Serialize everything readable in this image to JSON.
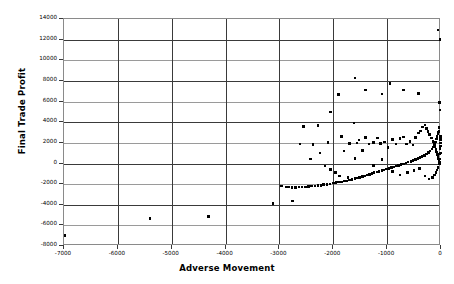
{
  "chart_data": {
    "type": "scatter",
    "title": "",
    "xlabel": "Adverse Movement",
    "ylabel": "Final Trade Profit",
    "xlim": [
      -7000,
      0
    ],
    "ylim": [
      -8000,
      14000
    ],
    "xticks": [
      -7000,
      -6000,
      -5000,
      -4000,
      -3000,
      -2000,
      -1000,
      0
    ],
    "xtick_labels": [
      "-7000",
      "-6000",
      "-5000",
      "-4000",
      "-3000",
      "-2000",
      "-1000",
      "0"
    ],
    "yticks": [
      -8000,
      -6000,
      -4000,
      -2000,
      0,
      2000,
      4000,
      6000,
      8000,
      10000,
      12000,
      14000
    ],
    "ytick_labels": [
      "-8000",
      "-6000",
      "-4000",
      "-2000",
      "0",
      "2000",
      "4000",
      "6000",
      "8000",
      "10000",
      "12000",
      "14000"
    ],
    "grid": true,
    "legend": null,
    "marker": "square",
    "marker_color": "#000000",
    "series": [
      {
        "name": "trades",
        "points": [
          [
            -6980,
            -7000
          ],
          [
            -5400,
            -5350
          ],
          [
            -4320,
            -5130
          ],
          [
            -3120,
            -3880
          ],
          [
            -2760,
            -3620
          ],
          [
            -2960,
            -2180
          ],
          [
            -2880,
            -2260
          ],
          [
            -2830,
            -2300
          ],
          [
            -2770,
            -2330
          ],
          [
            -2700,
            -2350
          ],
          [
            -2640,
            -2300
          ],
          [
            -2580,
            -2270
          ],
          [
            -2520,
            -2300
          ],
          [
            -2460,
            -2250
          ],
          [
            -2400,
            -2180
          ],
          [
            -2340,
            -2200
          ],
          [
            -2280,
            -2150
          ],
          [
            -2230,
            -2120
          ],
          [
            -2180,
            -2060
          ],
          [
            -2120,
            -2020
          ],
          [
            -2060,
            -1980
          ],
          [
            -2000,
            -1900
          ],
          [
            -1950,
            -1860
          ],
          [
            -1900,
            -1800
          ],
          [
            -1850,
            -1790
          ],
          [
            -1800,
            -1720
          ],
          [
            -1750,
            -1680
          ],
          [
            -1700,
            -1600
          ],
          [
            -1650,
            -1560
          ],
          [
            -1600,
            -1480
          ],
          [
            -1560,
            -1420
          ],
          [
            -1510,
            -1350
          ],
          [
            -1460,
            -1280
          ],
          [
            -1420,
            -1200
          ],
          [
            -1370,
            -1130
          ],
          [
            -1330,
            -1050
          ],
          [
            -1280,
            -980
          ],
          [
            -1240,
            -900
          ],
          [
            -1190,
            -830
          ],
          [
            -1150,
            -760
          ],
          [
            -1100,
            -680
          ],
          [
            -1060,
            -620
          ],
          [
            -1010,
            -540
          ],
          [
            -970,
            -470
          ],
          [
            -920,
            -400
          ],
          [
            -880,
            -320
          ],
          [
            -830,
            -250
          ],
          [
            -790,
            -180
          ],
          [
            -740,
            -100
          ],
          [
            -700,
            -40
          ],
          [
            -650,
            40
          ],
          [
            -610,
            120
          ],
          [
            -560,
            200
          ],
          [
            -520,
            280
          ],
          [
            -470,
            380
          ],
          [
            -430,
            460
          ],
          [
            -390,
            560
          ],
          [
            -350,
            660
          ],
          [
            -310,
            780
          ],
          [
            -270,
            900
          ],
          [
            -230,
            1050
          ],
          [
            -200,
            1200
          ],
          [
            -170,
            1400
          ],
          [
            -145,
            1600
          ],
          [
            -120,
            1850
          ],
          [
            -100,
            2100
          ],
          [
            -85,
            2350
          ],
          [
            -70,
            2600
          ],
          [
            -58,
            2850
          ],
          [
            -48,
            3050
          ],
          [
            -40,
            3150
          ],
          [
            -2380,
            1850
          ],
          [
            -2250,
            1000
          ],
          [
            -2100,
            2050
          ],
          [
            -1850,
            2600
          ],
          [
            -1800,
            1200
          ],
          [
            -1700,
            1950
          ],
          [
            -1620,
            3900
          ],
          [
            -1560,
            2000
          ],
          [
            -1520,
            2250
          ],
          [
            -1460,
            1250
          ],
          [
            -1400,
            2500
          ],
          [
            -1340,
            1900
          ],
          [
            -1250,
            2050
          ],
          [
            -1180,
            2450
          ],
          [
            -1120,
            1950
          ],
          [
            -1050,
            2100
          ],
          [
            -980,
            1550
          ],
          [
            -900,
            2300
          ],
          [
            -840,
            1900
          ],
          [
            -760,
            2400
          ],
          [
            -700,
            2550
          ],
          [
            -640,
            1900
          ],
          [
            -580,
            2150
          ],
          [
            -520,
            1800
          ],
          [
            -470,
            2500
          ],
          [
            -420,
            2950
          ],
          [
            -380,
            3150
          ],
          [
            -340,
            3550
          ],
          [
            -300,
            3750
          ],
          [
            -270,
            3400
          ],
          [
            -240,
            3100
          ],
          [
            -210,
            2800
          ],
          [
            -180,
            2450
          ],
          [
            -150,
            2150
          ],
          [
            -130,
            1900
          ],
          [
            -110,
            1600
          ],
          [
            -95,
            1350
          ],
          [
            -80,
            1100
          ],
          [
            -65,
            850
          ],
          [
            -55,
            650
          ],
          [
            -45,
            450
          ],
          [
            -38,
            250
          ],
          [
            -30,
            100
          ],
          [
            -25,
            -50
          ],
          [
            -20,
            450
          ],
          [
            -18,
            900
          ],
          [
            -15,
            1450
          ],
          [
            -12,
            2000
          ],
          [
            -10,
            2600
          ],
          [
            -20,
            5200
          ],
          [
            -25,
            5900
          ],
          [
            -15,
            12000
          ],
          [
            -60,
            12950
          ],
          [
            -420,
            6800
          ],
          [
            -700,
            7100
          ],
          [
            -950,
            7750
          ],
          [
            -1100,
            6750
          ],
          [
            -1400,
            7100
          ],
          [
            -1600,
            8300
          ],
          [
            -1900,
            6700
          ],
          [
            -2050,
            5000
          ],
          [
            -2280,
            3700
          ],
          [
            -2550,
            3600
          ],
          [
            -2620,
            1900
          ],
          [
            -2420,
            450
          ],
          [
            -2150,
            -250
          ],
          [
            -2050,
            -580
          ],
          [
            -1960,
            -900
          ],
          [
            -1880,
            -1200
          ],
          [
            -1730,
            -1350
          ],
          [
            -1600,
            500
          ],
          [
            -1250,
            -200
          ],
          [
            -1100,
            400
          ],
          [
            -900,
            -800
          ],
          [
            -760,
            -1100
          ],
          [
            -620,
            -900
          ],
          [
            -500,
            -700
          ],
          [
            -400,
            -500
          ],
          [
            -300,
            -1200
          ],
          [
            -220,
            -1500
          ],
          [
            -160,
            -1350
          ],
          [
            -120,
            -1100
          ],
          [
            -90,
            -900
          ],
          [
            -70,
            -650
          ],
          [
            -55,
            -400
          ],
          [
            -8,
            1000
          ],
          [
            -6,
            1700
          ],
          [
            -5,
            2300
          ],
          [
            -35,
            3500
          ]
        ]
      }
    ]
  }
}
